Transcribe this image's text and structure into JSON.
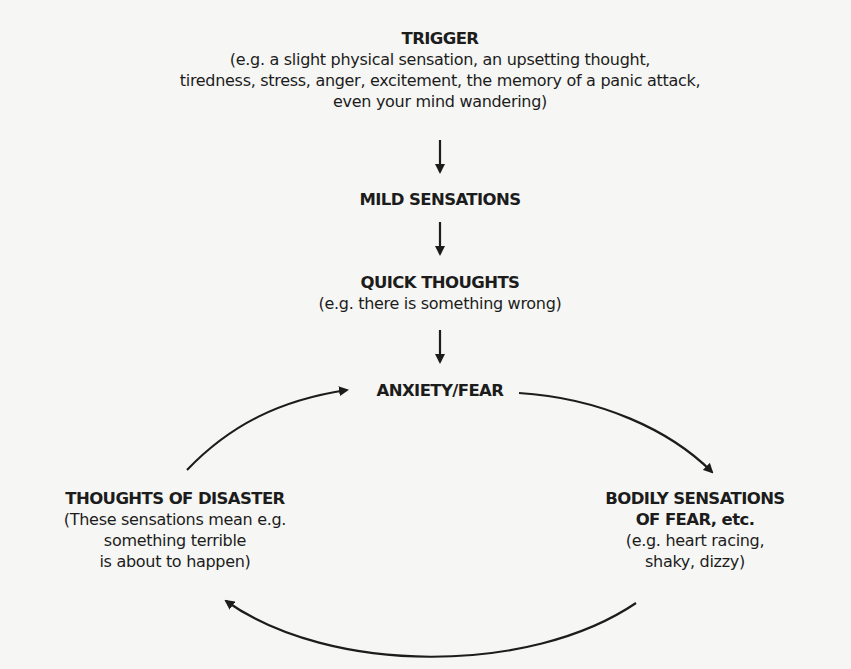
{
  "diagram": {
    "type": "flowchart-cycle",
    "nodes": {
      "trigger": {
        "title": "TRIGGER",
        "desc_lines": [
          "(e.g. a slight physical sensation, an upsetting thought,",
          "tiredness, stress, anger, excitement, the memory of a panic attack,",
          "even your mind wandering)"
        ]
      },
      "mild_sensations": {
        "title": "MILD SENSATIONS"
      },
      "quick_thoughts": {
        "title": "QUICK THOUGHTS",
        "desc_lines": [
          "(e.g. there is something wrong)"
        ]
      },
      "anxiety_fear": {
        "title": "ANXIETY/FEAR"
      },
      "bodily_sensations": {
        "title_lines": [
          "BODILY SENSATIONS",
          "OF FEAR, etc."
        ],
        "desc_lines": [
          "(e.g. heart racing,",
          "shaky, dizzy)"
        ]
      },
      "thoughts_of_disaster": {
        "title": "THOUGHTS OF DISASTER",
        "desc_lines": [
          "(These sensations mean e.g.",
          "something terrible",
          "is about to happen)"
        ]
      }
    },
    "edges": [
      {
        "from": "TRIGGER",
        "to": "MILD SENSATIONS",
        "style": "straight-down"
      },
      {
        "from": "MILD SENSATIONS",
        "to": "QUICK THOUGHTS",
        "style": "straight-down"
      },
      {
        "from": "QUICK THOUGHTS",
        "to": "ANXIETY/FEAR",
        "style": "straight-down"
      },
      {
        "from": "ANXIETY/FEAR",
        "to": "BODILY SENSATIONS OF FEAR, etc.",
        "style": "curved"
      },
      {
        "from": "BODILY SENSATIONS OF FEAR, etc.",
        "to": "THOUGHTS OF DISASTER",
        "style": "curved"
      },
      {
        "from": "THOUGHTS OF DISASTER",
        "to": "ANXIETY/FEAR",
        "style": "curved"
      }
    ],
    "colors": {
      "background": "#f6f6f4",
      "ink": "#1c1c1c"
    }
  }
}
